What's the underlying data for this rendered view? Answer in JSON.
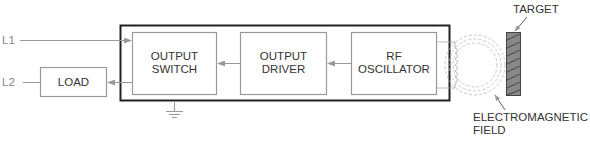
{
  "terminals": {
    "l1": "L1",
    "l2": "L2"
  },
  "blocks": {
    "load": "LOAD",
    "output_switch": [
      "OUTPUT",
      "SWITCH"
    ],
    "output_driver": [
      "OUTPUT",
      "DRIVER"
    ],
    "rf_oscillator": [
      "RF",
      "OSCILLATOR"
    ]
  },
  "labels": {
    "target": "TARGET",
    "field": [
      "ELECTROMAGNETIC",
      "FIELD"
    ]
  },
  "colors": {
    "outer_box": "#222222",
    "inner_box": "#999999",
    "wire": "#999999",
    "target_fill": "#888888"
  }
}
